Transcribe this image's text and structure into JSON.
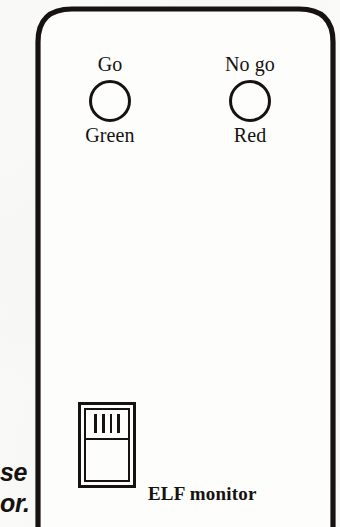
{
  "figure": {
    "subject": "ELF monitor",
    "panel": {
      "shape": "rounded-rectangle",
      "stroke_color": "#161210",
      "background_color": "#fdfdfb"
    },
    "indicators": [
      {
        "id": "go",
        "top_label": "Go",
        "bottom_label": "Green",
        "icon": "led-circle-icon"
      },
      {
        "id": "no-go",
        "top_label": "No go",
        "bottom_label": "Red",
        "icon": "led-circle-icon"
      }
    ],
    "switch": {
      "type": "rocker-switch",
      "ridge_count": 4
    },
    "device_label": "ELF monitor",
    "caption_fragments": [
      "se",
      "or."
    ]
  }
}
